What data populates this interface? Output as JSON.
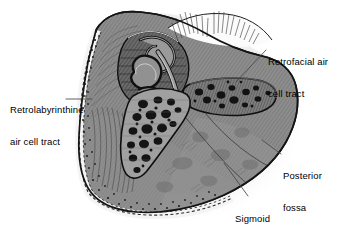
{
  "figure": {
    "type": "medical-illustration",
    "style": "grayscale pen-and-ink anatomical drawing",
    "background_color": "#ffffff",
    "bone_fill_color": "#8a8a8a",
    "outline_color": "#1a1a1a",
    "air_cell_color": "#1c1c1c",
    "shadow_color": "#e2e2e2",
    "label_color": "#000000",
    "leader_color": "#3a3a3a"
  },
  "labels": [
    {
      "id": "retrofacial",
      "lines": [
        "Retrofacial air",
        "cell tract"
      ],
      "text": "Retrofacial air cell tract",
      "position": "top-right"
    },
    {
      "id": "retrolabyrinthine",
      "lines": [
        "Retrolabyrinthine",
        "air cell tract"
      ],
      "text": "Retrolabyrinthine air cell tract",
      "position": "left"
    },
    {
      "id": "posterior_fossa",
      "lines": [
        "Posterior",
        "fossa",
        "bone plate"
      ],
      "text": "Posterior fossa bone plate",
      "position": "bottom-right"
    },
    {
      "id": "sigmoid_sinus",
      "lines": [
        "Sigmoid",
        "sinus"
      ],
      "text": "Sigmoid sinus",
      "position": "bottom-center-right"
    }
  ]
}
